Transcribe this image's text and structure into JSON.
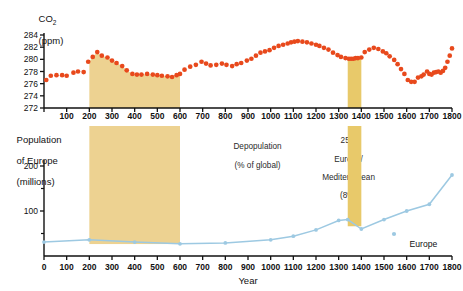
{
  "figure": {
    "background": "#ffffff",
    "co2_color": "#E8491C",
    "pop_color": "#9DC9E2",
    "band_color": "#EDD291",
    "band_color_narrow": "#E8C96A",
    "axis_color": "#111111"
  },
  "top_panel": {
    "y_axis_title_line1": "CO",
    "y_axis_title_sub": "2",
    "y_axis_title_line2": "(ppm)",
    "y_ticks": [
      272,
      274,
      276,
      278,
      280,
      282,
      284
    ],
    "x_ticks": [
      0,
      100,
      200,
      300,
      400,
      500,
      600,
      700,
      800,
      900,
      1000,
      1100,
      1200,
      1300,
      1400,
      1500,
      1600,
      1700,
      1800
    ]
  },
  "bottom_panel": {
    "y_axis_title_line1": "Population",
    "y_axis_title_line2": "of Europe",
    "y_axis_title_line3": "(millions)",
    "y_ticks": [
      100,
      200
    ],
    "y_tick_minor": [
      50,
      150
    ],
    "x_ticks": [
      0,
      100,
      200,
      300,
      400,
      500,
      600,
      700,
      800,
      900,
      1000,
      1100,
      1200,
      1300,
      1400,
      1500,
      1600,
      1700,
      1800
    ],
    "x_axis_title": "Year",
    "legend": {
      "label": "Europe",
      "marker": "dot"
    }
  },
  "annotations": [
    {
      "id": "band-roman",
      "line1": "10m Europe/",
      "line2": "Mediterranean",
      "line3": "(5%)",
      "x_start": 200,
      "x_end": 600
    },
    {
      "id": "depopulation",
      "line1": "Depopulation",
      "line2": "(% of global)"
    },
    {
      "id": "band-plague",
      "line1": "25m",
      "line2": "Europe/",
      "line3": "Mediterranean",
      "line4": "(8%)",
      "x_start": 1340,
      "x_end": 1400
    }
  ],
  "chart_data": {
    "type": "scatter",
    "title": "",
    "xlabel": "Year",
    "xlim": [
      0,
      1800
    ],
    "grid": false,
    "legend_position": "bottom-right",
    "panels": [
      {
        "name": "co2",
        "type": "scatter",
        "ylabel": "CO2 (ppm)",
        "ylim": [
          272,
          285
        ],
        "yticks": [
          272,
          274,
          276,
          278,
          280,
          282,
          284
        ],
        "color": "#E8491C",
        "shaded_bands": [
          {
            "x_start": 200,
            "x_end": 600,
            "color": "#EDD291",
            "fill_to_curve": true
          },
          {
            "x_start": 1340,
            "x_end": 1400,
            "color": "#E8C96A",
            "fill_to_curve": true
          }
        ],
        "x": [
          10,
          30,
          55,
          80,
          100,
          130,
          150,
          175,
          195,
          215,
          235,
          255,
          280,
          300,
          320,
          345,
          365,
          390,
          410,
          430,
          455,
          480,
          500,
          520,
          545,
          565,
          585,
          600,
          620,
          645,
          670,
          695,
          715,
          735,
          760,
          785,
          805,
          830,
          850,
          870,
          895,
          915,
          935,
          955,
          975,
          995,
          1015,
          1035,
          1055,
          1075,
          1090,
          1105,
          1120,
          1140,
          1160,
          1180,
          1200,
          1215,
          1235,
          1255,
          1275,
          1295,
          1310,
          1330,
          1345,
          1355,
          1365,
          1375,
          1385,
          1400,
          1415,
          1435,
          1455,
          1475,
          1495,
          1510,
          1525,
          1545,
          1560,
          1575,
          1590,
          1605,
          1620,
          1635,
          1650,
          1665,
          1675,
          1690,
          1700,
          1710,
          1720,
          1730,
          1740,
          1750,
          1760,
          1770,
          1780,
          1790,
          1800
        ],
        "y": [
          276.6,
          277.3,
          277.4,
          277.4,
          277.3,
          277.8,
          278.0,
          277.9,
          279.6,
          280.4,
          281.2,
          280.6,
          280.3,
          279.8,
          279.4,
          278.9,
          278.2,
          277.6,
          277.5,
          277.5,
          277.6,
          277.5,
          277.4,
          277.3,
          277.2,
          277.1,
          277.4,
          277.6,
          278.3,
          278.8,
          279.1,
          279.6,
          279.3,
          279.0,
          279.1,
          279.3,
          279.1,
          278.9,
          279.2,
          279.4,
          279.8,
          280.1,
          280.6,
          281.1,
          281.3,
          281.5,
          281.9,
          282.2,
          282.4,
          282.6,
          282.8,
          282.9,
          283.0,
          282.9,
          282.8,
          282.6,
          282.4,
          282.2,
          281.9,
          281.6,
          281.1,
          280.7,
          280.4,
          280.2,
          280.1,
          280.1,
          280.1,
          280.2,
          280.2,
          280.3,
          281.2,
          281.6,
          281.9,
          281.7,
          281.3,
          281.0,
          280.5,
          279.9,
          279.2,
          278.4,
          277.6,
          276.6,
          276.3,
          276.3,
          277.0,
          277.2,
          277.5,
          278.0,
          277.6,
          277.5,
          277.8,
          277.9,
          278.0,
          277.8,
          278.1,
          278.6,
          279.6,
          280.6,
          281.8,
          283.2
        ]
      },
      {
        "name": "population",
        "type": "line",
        "ylabel": "Population of Europe (millions)",
        "ylim": [
          0,
          210
        ],
        "yticks": [
          100,
          200
        ],
        "color": "#9DC9E2",
        "series_name": "Europe",
        "shaded_bands": [
          {
            "x_start": 200,
            "x_end": 600,
            "color": "#EDD291"
          },
          {
            "x_start": 1340,
            "x_end": 1400,
            "color": "#E8C96A"
          }
        ],
        "x": [
          0,
          200,
          400,
          600,
          800,
          1000,
          1100,
          1200,
          1300,
          1340,
          1400,
          1500,
          1600,
          1700,
          1800
        ],
        "y": [
          31,
          36,
          31,
          27,
          29,
          36,
          44,
          58,
          79,
          81,
          60,
          81,
          100,
          115,
          180
        ]
      }
    ]
  }
}
